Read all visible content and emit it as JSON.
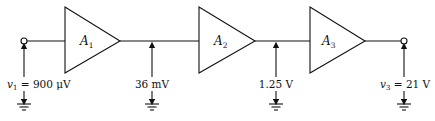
{
  "diagram": {
    "type": "cascaded amplifier chain",
    "amplifiers": [
      {
        "symbol": "A",
        "subscript": "1"
      },
      {
        "symbol": "A",
        "subscript": "2"
      },
      {
        "symbol": "A",
        "subscript": "3"
      }
    ],
    "input": {
      "var": "v",
      "sub": "1",
      "value": " = 900 μV"
    },
    "node_1_2": {
      "label": "36 mV"
    },
    "node_2_3": {
      "label": "1.25 V"
    },
    "output": {
      "var": "v",
      "sub": "3",
      "value": " = 21 V"
    }
  }
}
